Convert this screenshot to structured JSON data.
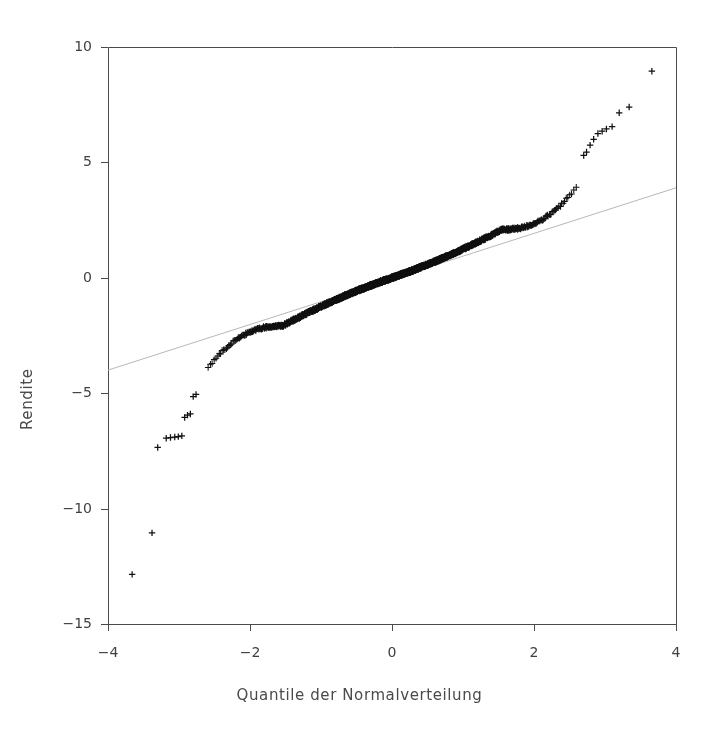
{
  "chart_data": {
    "type": "scatter",
    "title": "",
    "subtitle": "",
    "xlabel": "Quantile der Normalverteilung",
    "ylabel": "Rendite",
    "xlim": [
      -4,
      4
    ],
    "ylim": [
      -15,
      10
    ],
    "xticks": [
      -4,
      -2,
      0,
      2,
      4
    ],
    "xtick_labels": [
      "−4",
      "−2",
      "0",
      "2",
      "4"
    ],
    "yticks": [
      10,
      5,
      0,
      -5,
      -10,
      -15
    ],
    "ytick_labels": [
      "10",
      "5",
      "0",
      "−5",
      "−10",
      "−15"
    ],
    "grid": false,
    "legend": null,
    "marker": "plus",
    "marker_color": "#111111",
    "point_count": 2200,
    "annotations": [],
    "reference_line": {
      "name": "qq-reference-line",
      "x": [
        -4,
        4
      ],
      "y": [
        -4.0,
        3.9
      ],
      "color": "#b8b8b8",
      "width": 1,
      "slope": 0.99,
      "intercept": -0.05
    },
    "series": [
      {
        "name": "Stichprobenquantile",
        "description": "Empirische Renditequantile gegen Normalquantile (heavy tails)",
        "n": 2200,
        "dist": {
          "core_scale": 1.35,
          "tail_power": 2.35,
          "tail_threshold": 1.55
        },
        "outliers_low": [
          {
            "x": -3.66,
            "y": -12.85
          },
          {
            "x": -3.38,
            "y": -11.05
          },
          {
            "x": -3.3,
            "y": -7.35
          },
          {
            "x": -3.18,
            "y": -6.95
          },
          {
            "x": -3.12,
            "y": -6.92
          },
          {
            "x": -3.06,
            "y": -6.9
          },
          {
            "x": -3.01,
            "y": -6.88
          },
          {
            "x": -2.96,
            "y": -6.85
          },
          {
            "x": -2.92,
            "y": -6.05
          },
          {
            "x": -2.88,
            "y": -5.95
          },
          {
            "x": -2.84,
            "y": -5.9
          },
          {
            "x": -2.8,
            "y": -5.15
          },
          {
            "x": -2.76,
            "y": -5.05
          }
        ],
        "outliers_high": [
          {
            "x": 3.66,
            "y": 8.95
          },
          {
            "x": 3.34,
            "y": 7.4
          },
          {
            "x": 3.2,
            "y": 7.15
          },
          {
            "x": 3.1,
            "y": 6.55
          },
          {
            "x": 3.02,
            "y": 6.45
          },
          {
            "x": 2.96,
            "y": 6.35
          },
          {
            "x": 2.9,
            "y": 6.25
          },
          {
            "x": 2.84,
            "y": 6.0
          },
          {
            "x": 2.79,
            "y": 5.75
          },
          {
            "x": 2.74,
            "y": 5.45
          },
          {
            "x": 2.7,
            "y": 5.3
          }
        ]
      }
    ]
  },
  "figure": {
    "background": "#ffffff",
    "frame_color": "#4a4a4a",
    "axes_box": {
      "left": 108,
      "top": 47,
      "right": 676,
      "bottom": 624
    }
  }
}
